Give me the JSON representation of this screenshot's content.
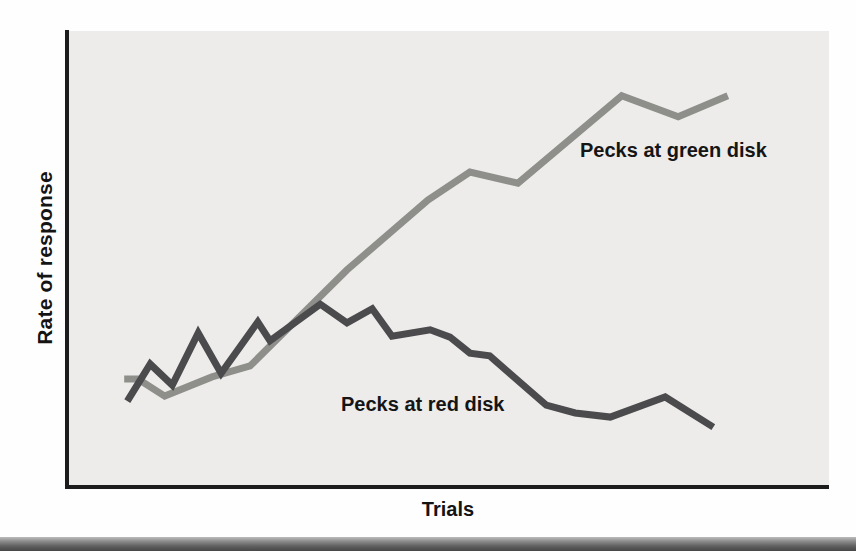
{
  "chart_data": {
    "type": "line",
    "title": "",
    "xlabel": "Trials",
    "ylabel": "Rate of response",
    "xlim": [
      0,
      100
    ],
    "ylim": [
      0,
      100
    ],
    "grid": false,
    "ticks": "none",
    "legend": "inline-labels",
    "plot_background_color": "#edecea",
    "axis_color": "#1c1c1c",
    "series": [
      {
        "key": "green",
        "label": "Pecks at green disk",
        "color": "#8e8f8b",
        "x": [
          7.5,
          9.3,
          12.8,
          19.0,
          24.0,
          36.7,
          47.3,
          52.8,
          59.1,
          72.7,
          80.1,
          86.6
        ],
        "y": [
          23.6,
          23.6,
          19.9,
          24.1,
          26.5,
          47.5,
          62.8,
          68.9,
          66.5,
          85.6,
          81.0,
          85.6
        ]
      },
      {
        "key": "red",
        "label": "Pecks at red disk",
        "color": "#4b4b4d",
        "x": [
          7.9,
          10.9,
          13.8,
          17.2,
          20.2,
          25.0,
          26.6,
          33.2,
          36.7,
          40.0,
          42.6,
          47.6,
          50.2,
          52.8,
          55.4,
          62.8,
          66.6,
          71.2,
          78.4,
          84.7
        ],
        "y": [
          18.8,
          26.9,
          22.3,
          33.7,
          24.9,
          36.1,
          32.0,
          40.0,
          35.9,
          39.0,
          33.0,
          34.4,
          32.8,
          29.3,
          28.7,
          17.9,
          16.2,
          15.3,
          19.7,
          13.1
        ]
      }
    ]
  },
  "decorations": {
    "bottom_bar_top_color": "#bcbcbc",
    "bottom_bar_bottom_color": "#474747"
  }
}
